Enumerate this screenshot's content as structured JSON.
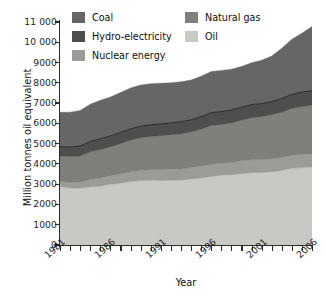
{
  "chart_data": {
    "type": "area",
    "title": "",
    "xlabel": "Year",
    "ylabel": "Million tonnes oil equivalent",
    "xlim": [
      1981,
      2006
    ],
    "ylim": [
      0,
      11000
    ],
    "ytick_step": 1000,
    "grid": false,
    "stacked": true,
    "legend_position": "top-inside",
    "x": [
      1981,
      1982,
      1983,
      1984,
      1985,
      1986,
      1987,
      1988,
      1989,
      1990,
      1991,
      1992,
      1993,
      1994,
      1995,
      1996,
      1997,
      1998,
      1999,
      2000,
      2001,
      2002,
      2003,
      2004,
      2005,
      2006
    ],
    "xtick_labels": [
      "1981",
      "1986",
      "1991",
      "1996",
      "2001",
      "2006"
    ],
    "xtick_values": [
      1981,
      1986,
      1991,
      1996,
      2001,
      2006
    ],
    "ytick_labels": [
      "0",
      "1000",
      "2000",
      "3000",
      "4000",
      "5000",
      "6000",
      "7000",
      "8000",
      "9000",
      "10 000",
      "11 000"
    ],
    "series": [
      {
        "name": "Oil",
        "color": "#c8c8c4",
        "values": [
          2880,
          2810,
          2800,
          2870,
          2900,
          3000,
          3050,
          3130,
          3180,
          3200,
          3180,
          3200,
          3200,
          3260,
          3300,
          3380,
          3440,
          3460,
          3520,
          3570,
          3580,
          3610,
          3680,
          3780,
          3820,
          3850
        ]
      },
      {
        "name": "Nuclear energy",
        "color": "#9b9b98",
        "values": [
          250,
          280,
          300,
          360,
          400,
          420,
          450,
          480,
          500,
          510,
          530,
          540,
          550,
          560,
          580,
          590,
          600,
          610,
          630,
          630,
          630,
          640,
          630,
          650,
          650,
          640
        ]
      },
      {
        "name": "Natural gas",
        "color": "#7f7f7c",
        "values": [
          1260,
          1270,
          1290,
          1370,
          1410,
          1420,
          1500,
          1560,
          1610,
          1640,
          1680,
          1700,
          1730,
          1750,
          1830,
          1920,
          1910,
          1950,
          2000,
          2080,
          2120,
          2180,
          2240,
          2300,
          2360,
          2400
        ]
      },
      {
        "name": "Hydro-electricity",
        "color": "#4e4e4c",
        "values": [
          460,
          470,
          490,
          510,
          530,
          540,
          550,
          560,
          570,
          580,
          580,
          580,
          600,
          600,
          620,
          640,
          630,
          640,
          650,
          650,
          640,
          650,
          670,
          700,
          710,
          720
        ]
      },
      {
        "name": "Coal",
        "color": "#666664",
        "values": [
          1700,
          1720,
          1760,
          1830,
          1900,
          1920,
          1970,
          2020,
          2030,
          2030,
          2010,
          1980,
          1970,
          1970,
          1990,
          2030,
          2030,
          2010,
          2010,
          2060,
          2140,
          2240,
          2480,
          2720,
          2910,
          3170
        ]
      }
    ]
  },
  "axes": {
    "y_title": "Million tonnes oil equivalent",
    "x_title": "Year"
  },
  "legend": {
    "items": [
      {
        "label": "Coal",
        "color": "#666664"
      },
      {
        "label": "Hydro-electricity",
        "color": "#4e4e4c"
      },
      {
        "label": "Nuclear energy",
        "color": "#9b9b98"
      },
      {
        "label": "Natural gas",
        "color": "#7f7f7c"
      },
      {
        "label": "Oil",
        "color": "#c8c8c4"
      }
    ]
  }
}
